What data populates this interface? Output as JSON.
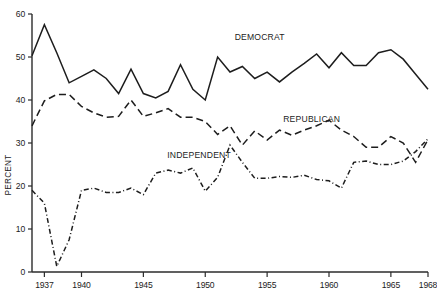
{
  "chart_data": {
    "type": "line",
    "title": "",
    "xlabel": "",
    "ylabel": "PERCENT",
    "xlim": [
      1936,
      1968
    ],
    "ylim": [
      0,
      60
    ],
    "grid": false,
    "legend_position": "inline-annotations",
    "x_ticks": [
      1937,
      1940,
      1945,
      1950,
      1955,
      1960,
      1965,
      1968
    ],
    "x_tick_labels": [
      "1937",
      "1940",
      "1945",
      "1950",
      "1955",
      "1960",
      "1965",
      "1968"
    ],
    "y_ticks": [
      0,
      10,
      20,
      30,
      40,
      50,
      60
    ],
    "y_tick_labels": [
      "0",
      "10",
      "20",
      "30",
      "40",
      "50",
      "60"
    ],
    "x": [
      1936,
      1937,
      1938,
      1939,
      1940,
      1941,
      1942,
      1943,
      1944,
      1945,
      1946,
      1947,
      1948,
      1949,
      1950,
      1951,
      1952,
      1953,
      1954,
      1955,
      1956,
      1957,
      1958,
      1959,
      1960,
      1961,
      1962,
      1963,
      1964,
      1965,
      1966,
      1967,
      1968
    ],
    "series": [
      {
        "name": "DEMOCRAT",
        "line_style": "solid",
        "color": "#1d1d1d",
        "label_x": 1954.4,
        "label_y": 54.0,
        "values": [
          50.3,
          57.5,
          51.0,
          44.0,
          45.5,
          47.0,
          45.0,
          41.5,
          47.2,
          41.5,
          40.5,
          42.0,
          48.2,
          42.5,
          40.0,
          50.0,
          46.5,
          47.8,
          45.0,
          46.5,
          44.2,
          46.5,
          48.5,
          50.7,
          47.5,
          51.0,
          48.0,
          48.0,
          51.0,
          51.7,
          49.5,
          46.0,
          42.5
        ]
      },
      {
        "name": "REPUBLICAN",
        "line_style": "dashed",
        "color": "#1d1d1d",
        "label_x": 1958.6,
        "label_y": 35.0,
        "values": [
          34.0,
          39.8,
          41.3,
          41.3,
          38.5,
          37.0,
          36.0,
          36.2,
          40.0,
          36.2,
          37.0,
          38.0,
          36.0,
          36.0,
          35.0,
          32.0,
          34.0,
          29.5,
          32.8,
          30.7,
          33.0,
          31.8,
          33.0,
          34.0,
          35.3,
          33.0,
          31.5,
          29.0,
          29.0,
          31.5,
          30.0,
          25.5,
          30.8
        ]
      },
      {
        "name": "INDEPENDENT",
        "line_style": "dash-dot",
        "color": "#1d1d1d",
        "label_x": 1949.5,
        "label_y": 26.5,
        "values": [
          19.0,
          16.0,
          1.3,
          7.5,
          19.0,
          19.5,
          18.5,
          18.5,
          19.5,
          18.0,
          23.0,
          23.7,
          23.0,
          24.2,
          18.8,
          22.0,
          29.5,
          25.5,
          21.8,
          21.8,
          22.2,
          22.0,
          22.5,
          21.5,
          21.2,
          19.5,
          25.5,
          25.8,
          25.0,
          25.0,
          25.8,
          28.0,
          31.0
        ]
      }
    ]
  },
  "axis": {
    "y_title": "PERCENT"
  }
}
